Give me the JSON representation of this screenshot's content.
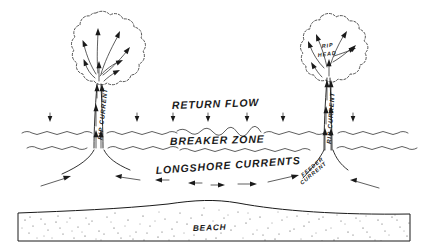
{
  "figure": {
    "title_text_visible": false,
    "type": "hand-drawn-diagram"
  },
  "labels": {
    "return_flow": "RETURN FLOW",
    "breaker_zone": "BREAKER ZONE",
    "longshore_currents": "LONGSHORE CURRENTS",
    "beach": "BEACH",
    "rip_head": "RIP\nHEAD",
    "rip_head_line1": "RIP",
    "rip_head_line2": "HEAD",
    "rip_current_left": "RIP CURRENT",
    "rip_current_right": "RIP CURRENT",
    "feeder_current_line1": "FEEDER",
    "feeder_current_line2": "CURRENT"
  },
  "colors": {
    "ink": "#1a1a1a",
    "background": "#ffffff",
    "stipple": "#3a3a3a",
    "cloud_outline": "#2a2a2a"
  },
  "elements": {
    "rip_head_cloud_left": "dashed-cloud-outline",
    "rip_head_cloud_right": "dashed-cloud-outline",
    "breaker_wave_line_upper": "wavy-line",
    "breaker_wave_line_lower": "wavy-line",
    "beach_profile": "stippled-sand-bank",
    "down_arrow_count": 7,
    "longshore_arrow_count": 4
  }
}
